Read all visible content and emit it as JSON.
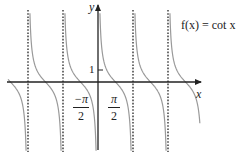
{
  "chart_data": {
    "type": "line",
    "title": "f(x) = cot x",
    "function": "cot x",
    "xlabel": "x",
    "ylabel": "y",
    "x_tick_labels": [
      "-π/2",
      "π/2"
    ],
    "y_tick_labels": [
      "1"
    ],
    "asymptotes_x": [
      "-2π",
      "-π",
      "π",
      "2π"
    ],
    "asymptote_style": "dotted",
    "domain_shown": "approximately [-2.6π, 3.1π]",
    "curve_color": "#999999",
    "axis_color": "#222222",
    "grid": false,
    "legend": null,
    "annotations": [
      {
        "text": "f(x) = cot x",
        "position": "top-right"
      }
    ]
  },
  "labels": {
    "y_axis": "y",
    "x_axis": "x",
    "y_tick_1": "1",
    "func_label": "f(x) = cot x",
    "neg_half_pi_num": "−π",
    "neg_half_pi_den": "2",
    "half_pi_num": "π",
    "half_pi_den": "2"
  }
}
